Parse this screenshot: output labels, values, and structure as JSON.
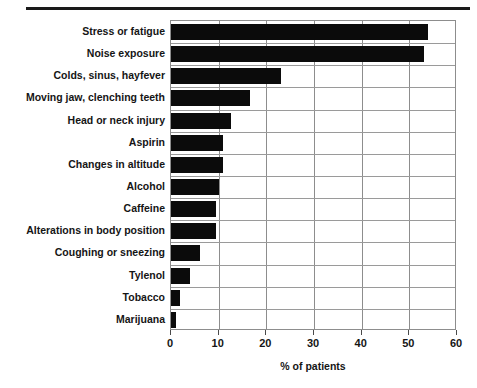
{
  "figure": {
    "top_rule": true,
    "background_color": "#ffffff",
    "bar_color": "#0b0b0b",
    "grid_color": "#8d8d8d",
    "text_color": "#151515"
  },
  "axis": {
    "x_title": "% of patients",
    "x_ticks": [
      "0",
      "10",
      "20",
      "30",
      "40",
      "50",
      "60"
    ]
  },
  "chart_data": {
    "type": "bar",
    "orientation": "horizontal",
    "title": "",
    "subtitle": "",
    "xlabel": "% of patients",
    "ylabel": "",
    "xlim": [
      0,
      60
    ],
    "xticks": [
      0,
      10,
      20,
      30,
      40,
      50,
      60
    ],
    "grid": true,
    "legend": null,
    "categories": [
      "Stress or fatigue",
      "Noise exposure",
      "Colds, sinus, hayfever",
      "Moving jaw, clenching teeth",
      "Head or neck injury",
      "Aspirin",
      "Changes in altitude",
      "Alcohol",
      "Caffeine",
      "Alterations in body position",
      "Coughing or sneezing",
      "Tylenol",
      "Tobacco",
      "Marijuana"
    ],
    "values": [
      54,
      53,
      23,
      16.5,
      12.5,
      11,
      11,
      10,
      9.5,
      9.5,
      6,
      4,
      1.8,
      1
    ],
    "units": "percent"
  }
}
